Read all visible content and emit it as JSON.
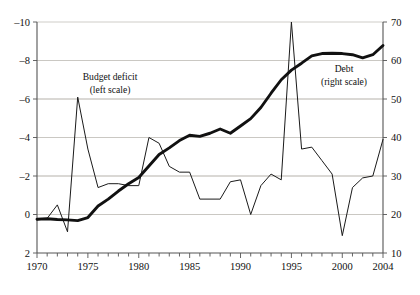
{
  "chart_data": {
    "type": "line",
    "title": "",
    "xlabel": "",
    "xlim": [
      1970,
      2004
    ],
    "x_ticks_labeled": [
      1970,
      1975,
      1980,
      1985,
      1990,
      1995,
      2000,
      2004
    ],
    "x_tick_interval": 1,
    "grid": true,
    "legend_position": "inline-annotation",
    "axes": [
      {
        "id": "left",
        "name": "Budget deficit (left scale)",
        "ylabel": "",
        "ylim": [
          2,
          -10
        ],
        "inverted": true,
        "ticks": [
          -10,
          -8,
          -6,
          -4,
          -2,
          0,
          2
        ],
        "tick_labels": [
          "–10",
          "–8",
          "–6",
          "–4",
          "–2",
          "0",
          "2"
        ]
      },
      {
        "id": "right",
        "name": "Debt (right scale)",
        "ylabel": "",
        "ylim": [
          10,
          70
        ],
        "inverted": false,
        "ticks": [
          10,
          20,
          30,
          40,
          50,
          60,
          70
        ],
        "tick_labels": [
          "10",
          "20",
          "30",
          "40",
          "50",
          "60",
          "70"
        ]
      }
    ],
    "annotations": [
      {
        "id": "budget-deficit-label",
        "line1": "Budget deficit",
        "line2": "(left scale)",
        "x": 110,
        "y": 80
      },
      {
        "id": "debt-label",
        "line1": "Debt",
        "line2": "(right scale)",
        "x": 344,
        "y": 72
      }
    ],
    "series": [
      {
        "name": "Budget deficit (left scale)",
        "axis": "left",
        "style": "thin",
        "color": "#1a1a1a",
        "x": [
          1970,
          1971,
          1972,
          1973,
          1974,
          1975,
          1976,
          1977,
          1978,
          1979,
          1980,
          1981,
          1982,
          1983,
          1984,
          1985,
          1986,
          1987,
          1988,
          1989,
          1990,
          1991,
          1992,
          1993,
          1994,
          1995,
          1996,
          1997,
          1998,
          1999,
          2000,
          2001,
          2002,
          2003,
          2004
        ],
        "values": [
          0.3,
          0.2,
          -0.5,
          0.9,
          -6.1,
          -3.4,
          -1.4,
          -1.6,
          -1.6,
          -1.5,
          -1.5,
          -4.0,
          -3.7,
          -2.5,
          -2.2,
          -2.2,
          -0.8,
          -0.8,
          -0.8,
          -1.7,
          -1.8,
          0.0,
          -1.5,
          -2.1,
          -1.8,
          -10.0,
          -3.4,
          -3.5,
          -2.8,
          -2.1,
          1.1,
          -1.4,
          -1.9,
          -2.0,
          -3.9
        ]
      },
      {
        "name": "Debt (right scale)",
        "axis": "right",
        "style": "bold",
        "color": "#111111",
        "x": [
          1970,
          1971,
          1972,
          1973,
          1974,
          1975,
          1976,
          1977,
          1978,
          1979,
          1980,
          1981,
          1982,
          1983,
          1984,
          1985,
          1986,
          1987,
          1988,
          1989,
          1990,
          1991,
          1992,
          1993,
          1994,
          1995,
          1996,
          1997,
          1998,
          1999,
          2000,
          2001,
          2002,
          2003,
          2004
        ],
        "values": [
          18.8,
          18.9,
          18.7,
          18.6,
          18.4,
          19.2,
          22.2,
          24.0,
          26.1,
          28.0,
          29.6,
          32.6,
          35.6,
          37.3,
          39.2,
          40.6,
          40.3,
          41.1,
          42.2,
          41.1,
          43.0,
          44.9,
          47.8,
          51.5,
          55.0,
          57.5,
          59.3,
          61.2,
          61.8,
          61.9,
          61.8,
          61.5,
          60.7,
          61.5,
          63.9
        ]
      }
    ]
  }
}
